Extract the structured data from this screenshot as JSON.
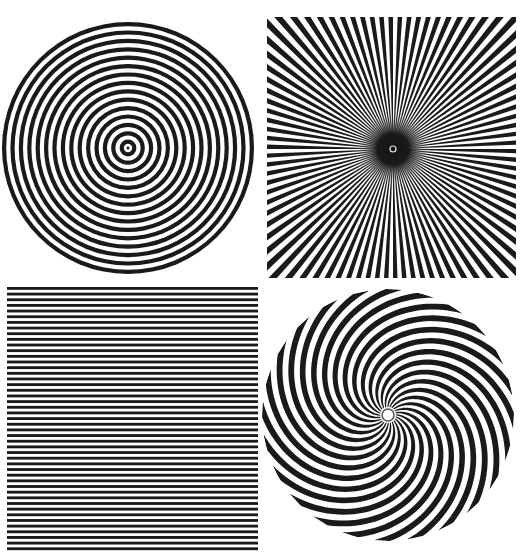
{
  "canvas": {
    "width": 523,
    "height": 559,
    "background": "#ffffff",
    "ink": "#1a1a1a"
  },
  "patterns": [
    {
      "id": "concentric",
      "type": "concentric-circles",
      "center": [
        128,
        148
      ],
      "radius": 126,
      "rings": 30,
      "center_dot": true
    },
    {
      "id": "starburst",
      "type": "radial-starburst",
      "box": [
        267,
        17,
        249,
        261
      ],
      "center": [
        393,
        149
      ],
      "rays": 180,
      "center_blot_radius": 16,
      "center_ring_radius": 3
    },
    {
      "id": "stripes",
      "type": "horizontal-lines",
      "box": [
        7,
        287,
        251,
        266
      ],
      "lines": 47
    },
    {
      "id": "spiral",
      "type": "spiral-arms",
      "center": [
        388,
        415
      ],
      "radius": 126,
      "arms": 24,
      "twist": 2.6,
      "center_ring_radius": 6
    }
  ]
}
